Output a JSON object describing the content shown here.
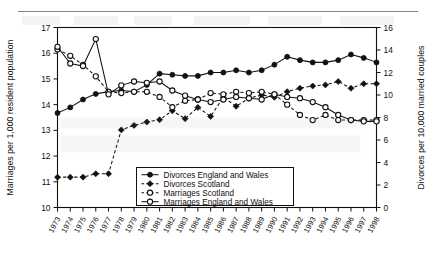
{
  "figure": {
    "background_color": "#ffffff",
    "ink_color": "#111111"
  },
  "chart_data": {
    "type": "line",
    "title": "",
    "xlabel": "",
    "ylabel": "Marriages per 1,000 resident population",
    "y2label": "Divorces per 10,000 married couples",
    "grid": false,
    "legend_position": "inside-bottom-left",
    "x": [
      1973,
      1974,
      1975,
      1976,
      1977,
      1978,
      1979,
      1980,
      1981,
      1982,
      1983,
      1984,
      1985,
      1986,
      1987,
      1988,
      1989,
      1990,
      1991,
      1992,
      1993,
      1994,
      1995,
      1996,
      1997,
      1998
    ],
    "xtick_labels": [
      "1973",
      "1974",
      "1975",
      "1976",
      "1977",
      "1978",
      "1979",
      "1980",
      "1981",
      "1982",
      "1983",
      "1984",
      "1985",
      "1986",
      "1987",
      "1988",
      "1989",
      "1990",
      "1991",
      "1992",
      "1993",
      "1994",
      "1995",
      "1996",
      "1997",
      "1998"
    ],
    "ylim": [
      10,
      17
    ],
    "ytick_labels": [
      "10",
      "11",
      "12",
      "13",
      "14",
      "15",
      "16",
      "17"
    ],
    "yticks": [
      10,
      11,
      12,
      13,
      14,
      15,
      16,
      17
    ],
    "y2lim": [
      0,
      16
    ],
    "y2tick_labels": [
      "0",
      "2",
      "4",
      "6",
      "8",
      "10",
      "12",
      "14",
      "16"
    ],
    "y2ticks": [
      0,
      2,
      4,
      6,
      8,
      10,
      12,
      14,
      16
    ],
    "series": [
      {
        "name": "Divorces  England and Wales",
        "axis": "right",
        "line_style": "solid",
        "marker": "filled-circle",
        "values": [
          8.4,
          8.9,
          9.6,
          10.1,
          10.3,
          10.4,
          10.3,
          10.9,
          11.9,
          11.8,
          11.7,
          11.7,
          12.0,
          12.0,
          12.2,
          12.0,
          12.2,
          12.7,
          13.4,
          13.1,
          12.9,
          12.9,
          13.1,
          13.6,
          13.3,
          12.9
        ]
      },
      {
        "name": "Divorces  Scotland",
        "axis": "right",
        "line_style": "dashed",
        "marker": "filled-diamond",
        "values": [
          2.7,
          2.7,
          2.7,
          3.0,
          3.0,
          6.9,
          7.3,
          7.6,
          7.8,
          8.6,
          7.9,
          8.9,
          8.1,
          9.8,
          9.0,
          9.7,
          10.0,
          9.8,
          10.3,
          10.6,
          10.8,
          10.9,
          11.2,
          10.6,
          11.0,
          11.0
        ]
      },
      {
        "name": "Marriages  Scotland",
        "axis": "left",
        "line_style": "dashed",
        "marker": "open-circle",
        "values": [
          16.15,
          15.9,
          15.55,
          15.1,
          14.5,
          14.45,
          14.5,
          14.5,
          14.3,
          13.9,
          14.15,
          14.2,
          14.45,
          14.4,
          14.5,
          14.45,
          14.5,
          14.4,
          14.0,
          13.6,
          13.4,
          13.6,
          13.4,
          13.4,
          13.4,
          13.4
        ]
      },
      {
        "name": "Marriages  England and Wales",
        "axis": "left",
        "line_style": "solid",
        "marker": "open-circle",
        "values": [
          16.25,
          15.6,
          15.5,
          16.55,
          14.4,
          14.75,
          14.9,
          14.85,
          14.9,
          14.55,
          14.35,
          14.2,
          14.1,
          14.2,
          14.3,
          14.25,
          14.2,
          14.4,
          14.3,
          14.25,
          14.1,
          13.9,
          13.6,
          13.4,
          13.35,
          13.35
        ]
      }
    ],
    "right_series_left_scale_values": {
      "note": "Right-axis values are plotted against the 0-16 divorce scale; left-axis marriage values use the 10-17 scale."
    }
  },
  "legend": {
    "items": [
      {
        "label": "Divorces  England and Wales",
        "marker": "filled-circle",
        "line_style": "solid"
      },
      {
        "label": "Divorces  Scotland",
        "marker": "filled-diamond",
        "line_style": "dashed"
      },
      {
        "label": "Marriages  Scotland",
        "marker": "open-circle",
        "line_style": "dashed"
      },
      {
        "label": "Marriages  England and Wales",
        "marker": "open-circle",
        "line_style": "solid"
      }
    ]
  }
}
